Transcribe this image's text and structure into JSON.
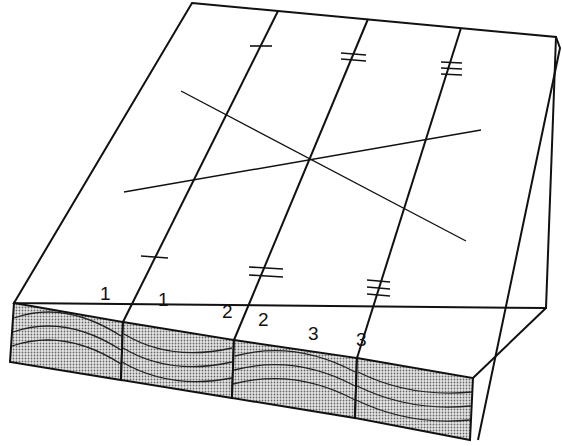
{
  "diagram": {
    "labels": [
      {
        "text": "1",
        "x": 100,
        "y": 284
      },
      {
        "text": "1",
        "x": 158,
        "y": 290
      },
      {
        "text": "2",
        "x": 222,
        "y": 302
      },
      {
        "text": "2",
        "x": 258,
        "y": 310
      },
      {
        "text": "3",
        "x": 308,
        "y": 324
      },
      {
        "text": "3",
        "x": 356,
        "y": 330
      }
    ],
    "colors": {
      "line": "#111111",
      "end_grain_fill": "#cfcfcf",
      "background": "#ffffff"
    }
  }
}
